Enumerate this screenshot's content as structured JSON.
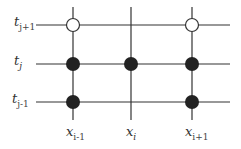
{
  "diagram": {
    "type": "finite-difference-stencil",
    "colors": {
      "line": "#333333",
      "filled_node": "#222222",
      "open_node_stroke": "#333333",
      "background": "#ffffff"
    },
    "time_levels": [
      {
        "base": "t",
        "sub": "j+1",
        "y": 25
      },
      {
        "base": "t",
        "sub": "j",
        "y": 64
      },
      {
        "base": "t",
        "sub": "j-1",
        "y": 102
      }
    ],
    "space_points": [
      {
        "base": "x",
        "sub": "i-1",
        "x": 73
      },
      {
        "base": "x",
        "sub": "i",
        "x": 131
      },
      {
        "base": "x",
        "sub": "i+1",
        "x": 192
      }
    ],
    "nodes": [
      {
        "id": "n-i-1-j+1",
        "col": 0,
        "row": 0,
        "kind": "open"
      },
      {
        "id": "n-i+1-j+1",
        "col": 2,
        "row": 0,
        "kind": "open"
      },
      {
        "id": "n-i-1-j",
        "col": 0,
        "row": 1,
        "kind": "filled"
      },
      {
        "id": "n-i-j",
        "col": 1,
        "row": 1,
        "kind": "filled"
      },
      {
        "id": "n-i+1-j",
        "col": 2,
        "row": 1,
        "kind": "filled"
      },
      {
        "id": "n-i-1-j-1",
        "col": 0,
        "row": 2,
        "kind": "filled"
      },
      {
        "id": "n-i+1-j-1",
        "col": 2,
        "row": 2,
        "kind": "filled"
      }
    ]
  }
}
